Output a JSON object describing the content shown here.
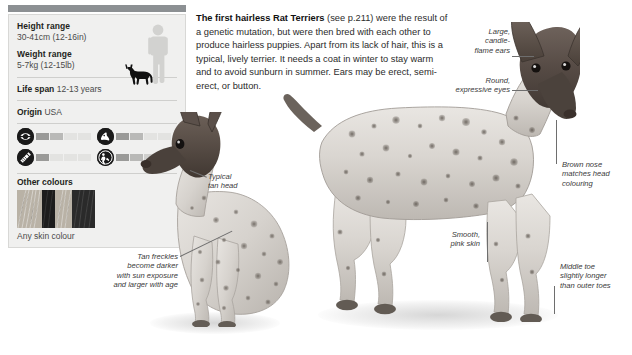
{
  "info_panel": {
    "height": {
      "label": "Height range",
      "value": "30-41cm (12-16in)"
    },
    "weight": {
      "label": "Weight range",
      "value": "5-7kg (12-15lb)"
    },
    "lifespan": {
      "label": "Life span",
      "value": "12-13 years"
    },
    "origin": {
      "label": "Origin",
      "value": "USA"
    },
    "ratings": [
      {
        "icon": "exercise-icon",
        "name": "exercise",
        "filled": 2,
        "total": 4
      },
      {
        "icon": "grooming-dog-icon",
        "name": "grooming",
        "filled": 2,
        "total": 4
      },
      {
        "icon": "brush-icon",
        "name": "brushing",
        "filled": 1,
        "total": 4
      },
      {
        "icon": "trainability-icon",
        "name": "trainability",
        "filled": 3,
        "total": 4
      }
    ],
    "other_colours": {
      "label": "Other colours",
      "caption": "Any skin colour"
    },
    "scale": {
      "human": "human-silhouette",
      "dog": "dog-silhouette"
    }
  },
  "body": {
    "lead": "The first hairless Rat Terriers",
    "rest": " (see p.211) were the result of a genetic mutation, but were then bred with each other to produce hairless puppies. Apart from its lack of hair, this is a typical, lively terrier. It needs a coat in winter to stay warm and to avoid sunburn in summer. Ears may be erect, semi-erect, or button."
  },
  "annotations": {
    "ears": "Large,\ncandle-\nflame ears",
    "eyes": "Round,\nexpressive eyes",
    "nose": "Brown nose\nmatches head\ncolouring",
    "toe": "Middle toe\nslightly longer\nthan outer toes",
    "skin": "Smooth,\npink skin",
    "tan_head": "Typical\ntan head",
    "freckles": "Tan freckles\nbecome darker\nwith sun exposure\nand larger with age"
  },
  "colors": {
    "panel_bg": "#f0f0ef",
    "top_rule": "#8c9093",
    "text": "#231f20",
    "muted": "#4a4a4a",
    "bar_empty": "#e3e3e1",
    "icon_fill": "#1a1a1a"
  }
}
